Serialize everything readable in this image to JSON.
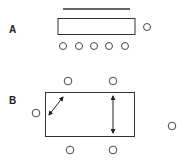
{
  "panels": {
    "a": {
      "label": "A"
    },
    "b": {
      "label": "B"
    }
  },
  "colors": {
    "stroke": "#333333",
    "background": "#ffffff"
  }
}
